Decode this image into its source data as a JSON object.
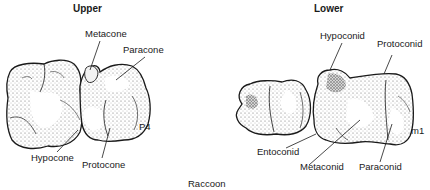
{
  "figure": {
    "caption": "Raccoon",
    "panels": [
      {
        "title": "Upper",
        "tooth_label": "P4",
        "cusps": [
          "Metacone",
          "Paracone",
          "Hypocone",
          "Protocone"
        ]
      },
      {
        "title": "Lower",
        "tooth_label": "m1",
        "cusps": [
          "Hypoconid",
          "Protoconid",
          "Entoconid",
          "Metaconid",
          "Paraconid"
        ]
      }
    ]
  },
  "colors": {
    "ink": "#1a1a1a",
    "background": "#ffffff",
    "shading": "#9a9a9a"
  }
}
